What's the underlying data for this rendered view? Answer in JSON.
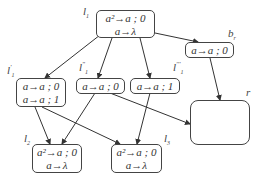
{
  "diagram": {
    "nodes": [
      {
        "id": "l1",
        "label": "l",
        "sub": "1",
        "prime": "",
        "rules": [
          "a²→a ; 0",
          "a→λ"
        ]
      },
      {
        "id": "br",
        "label": "b",
        "sub": "r",
        "prime": "",
        "rules": [
          "a→a ; 0"
        ]
      },
      {
        "id": "l1p",
        "label": "l",
        "sub": "1",
        "prime": "'",
        "rules": [
          "a→a ; 0",
          "a→a ; 1"
        ]
      },
      {
        "id": "l1pp",
        "label": "l",
        "sub": "1",
        "prime": "\"",
        "rules": [
          "a→a ; 0"
        ]
      },
      {
        "id": "l1ppp",
        "label": "l",
        "sub": "1",
        "prime": "'''",
        "rules": [
          "a→a ; 1"
        ]
      },
      {
        "id": "r",
        "label": "r",
        "sub": "",
        "prime": "",
        "rules": []
      },
      {
        "id": "l2",
        "label": "l",
        "sub": "2",
        "prime": "",
        "rules": [
          "a²→a ; 0",
          "a→λ"
        ]
      },
      {
        "id": "l3",
        "label": "l",
        "sub": "3",
        "prime": "",
        "rules": [
          "a²→a ; 0",
          "a→λ"
        ]
      }
    ],
    "edges": [
      {
        "from": "l1",
        "to": "l1p"
      },
      {
        "from": "l1",
        "to": "l1pp"
      },
      {
        "from": "l1",
        "to": "l1ppp"
      },
      {
        "from": "l1",
        "to": "br"
      },
      {
        "from": "br",
        "to": "r"
      },
      {
        "from": "l1p",
        "to": "l2"
      },
      {
        "from": "l1p",
        "to": "l3"
      },
      {
        "from": "l1pp",
        "to": "l2"
      },
      {
        "from": "l1pp",
        "to": "r"
      },
      {
        "from": "l1ppp",
        "to": "l3"
      }
    ]
  }
}
